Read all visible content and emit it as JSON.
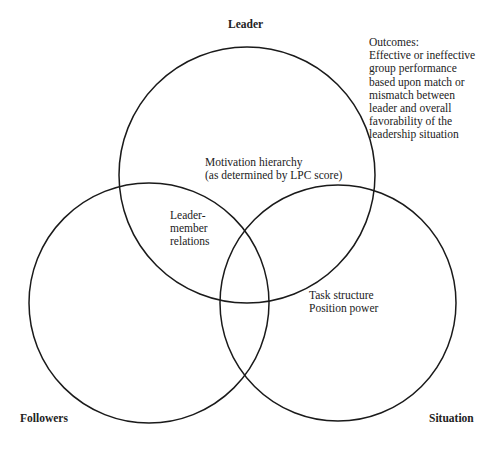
{
  "diagram": {
    "circles": [
      {
        "id": "leader",
        "label": "Leader",
        "cx": 247,
        "cy": 175,
        "r": 128
      },
      {
        "id": "followers",
        "label": "Followers",
        "cx": 149,
        "cy": 303,
        "r": 120
      },
      {
        "id": "situation",
        "label": "Situation",
        "cx": 338,
        "cy": 303,
        "r": 118
      }
    ],
    "stroke_color": "#1a1a1a"
  },
  "labels": {
    "leader": "Leader",
    "followers": "Followers",
    "situation": "Situation"
  },
  "regions": {
    "leader_only": [
      "Motivation hierarchy",
      "(as determined by LPC score)"
    ],
    "leader_followers": [
      "Leader-",
      "member",
      "relations"
    ],
    "situation_only": [
      "Task structure",
      "Position power"
    ]
  },
  "outcomes": {
    "lines": [
      "Outcomes:",
      "Effective or ineffective",
      "group performance",
      "based upon match or",
      "mismatch between",
      "leader and overall",
      "favorability of the",
      "leadership situation"
    ]
  }
}
